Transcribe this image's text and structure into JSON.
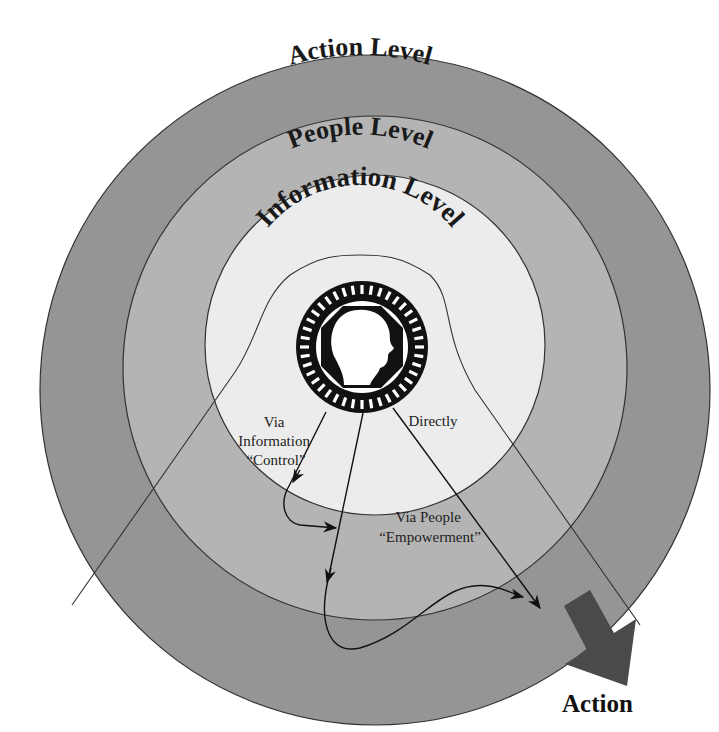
{
  "diagram": {
    "rings": [
      {
        "id": "action",
        "label": "Action Level",
        "color": "#959595"
      },
      {
        "id": "people",
        "label": "People Level",
        "color": "#b4b4b4"
      },
      {
        "id": "information",
        "label": "Information Level",
        "color": "#e8e8e8"
      }
    ],
    "center": {
      "label": "Leader",
      "icon": "head-profile-icon"
    },
    "paths": [
      {
        "id": "information-control",
        "label_lines": [
          "Via",
          "Information",
          "“Control”"
        ]
      },
      {
        "id": "people-empowerment",
        "label_lines": [
          "Via People",
          "“Empowerment”"
        ]
      },
      {
        "id": "directly",
        "label_lines": [
          "Directly"
        ]
      }
    ],
    "output": {
      "label": "Action",
      "icon": "arrow-down-right-icon",
      "color": "#4a4a4a"
    }
  }
}
